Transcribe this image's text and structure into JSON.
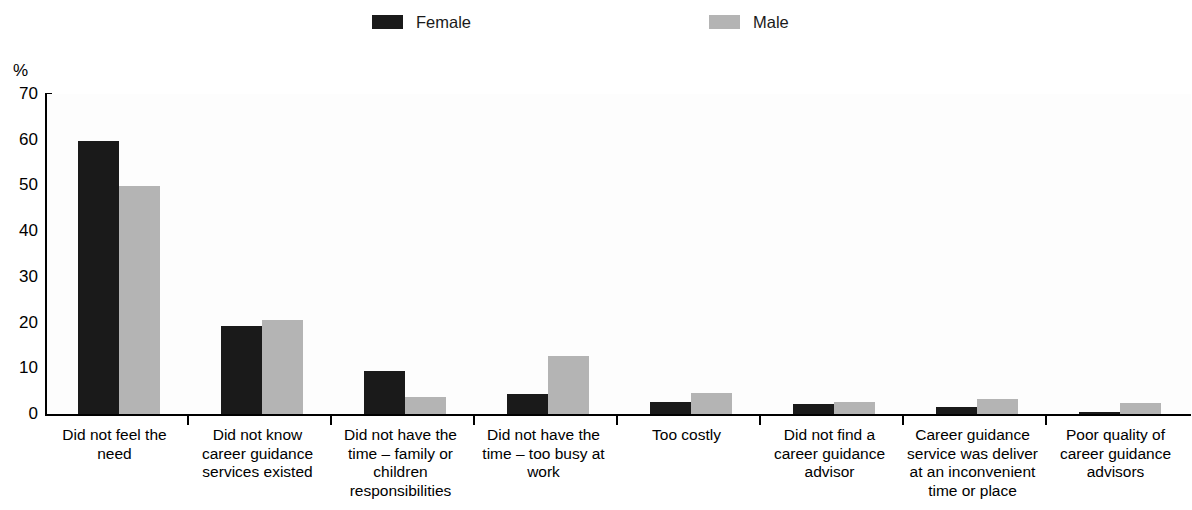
{
  "legend": {
    "entries": [
      {
        "label": "Female",
        "color": "#1a1a1a",
        "key": "female"
      },
      {
        "label": "Male",
        "color": "#b4b4b4",
        "key": "male"
      }
    ]
  },
  "axis": {
    "y_unit": "%",
    "y_ticks": [
      "0",
      "10",
      "20",
      "30",
      "40",
      "50",
      "60",
      "70"
    ]
  },
  "chart_data": {
    "type": "bar",
    "title": "",
    "subtitle": "",
    "xlabel": "",
    "ylabel": "%",
    "ylim": [
      0,
      70
    ],
    "ytick_step": 10,
    "grid": false,
    "legend_position": "top",
    "categories": [
      "Did not feel the need",
      "Did not know career guidance services existed",
      "Did not have the time – family or children responsibilities",
      "Did not have the time – too busy at work",
      "Too costly",
      "Did not find a career guidance advisor",
      "Career guidance service was deliver at an inconvenient time or place",
      "Poor quality of career guidance advisors"
    ],
    "series": [
      {
        "name": "Female",
        "color": "#1a1a1a",
        "values": [
          59.7,
          19.2,
          9.5,
          4.3,
          2.6,
          2.1,
          1.5,
          0.4
        ]
      },
      {
        "name": "Male",
        "color": "#b4b4b4",
        "values": [
          49.9,
          20.6,
          3.7,
          12.6,
          4.7,
          2.7,
          3.2,
          2.4
        ]
      }
    ]
  }
}
